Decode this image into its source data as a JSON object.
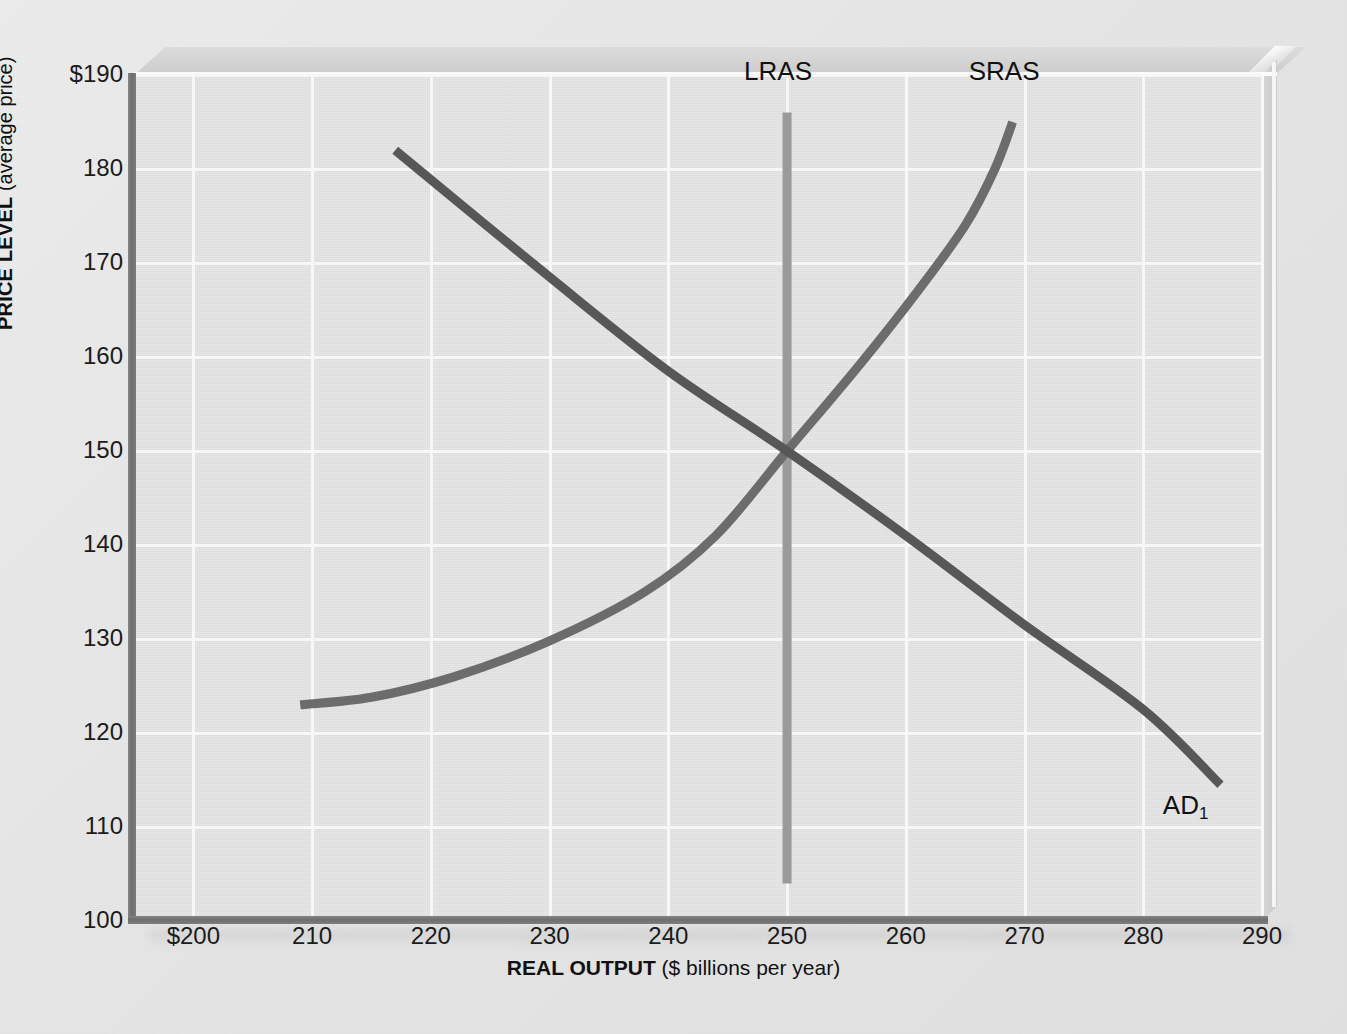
{
  "chart_data": {
    "type": "line",
    "title": "",
    "xlabel_bold": "REAL OUTPUT",
    "xlabel_rest": " ($ billions per year)",
    "ylabel_bold": "PRICE LEVEL",
    "ylabel_rest": " (average price)",
    "xlim": [
      195,
      290
    ],
    "ylim": [
      100,
      190
    ],
    "x_ticks": [
      "$200",
      "210",
      "220",
      "230",
      "240",
      "250",
      "260",
      "270",
      "280",
      "290"
    ],
    "x_tick_values": [
      200,
      210,
      220,
      230,
      240,
      250,
      260,
      270,
      280,
      290
    ],
    "y_ticks": [
      "$190",
      "180",
      "170",
      "160",
      "150",
      "140",
      "130",
      "120",
      "110",
      "100"
    ],
    "y_tick_values": [
      190,
      180,
      170,
      160,
      150,
      140,
      130,
      120,
      110,
      100
    ],
    "grid": true,
    "grid_color": "#f7f7f7",
    "plot_bg": "#e3e3e3",
    "legend_position": "inline-labels",
    "equilibrium": {
      "output": 250,
      "price_level": 150
    },
    "series": [
      {
        "name": "AD1",
        "label": "AD",
        "label_subscript": "1",
        "color": "#575757",
        "kind": "aggregate-demand",
        "points": [
          [
            217,
            182
          ],
          [
            230,
            168.5
          ],
          [
            240,
            158.5
          ],
          [
            250,
            150
          ],
          [
            260,
            141
          ],
          [
            270,
            131.5
          ],
          [
            280,
            122.5
          ],
          [
            286.5,
            114.5
          ]
        ]
      },
      {
        "name": "SRAS",
        "label": "SRAS",
        "color": "#6c6c6c",
        "kind": "short-run-aggregate-supply",
        "points": [
          [
            209,
            123
          ],
          [
            215,
            123.8
          ],
          [
            222,
            126
          ],
          [
            230,
            129.8
          ],
          [
            238,
            135
          ],
          [
            244,
            141
          ],
          [
            250,
            150
          ],
          [
            256,
            159
          ],
          [
            261,
            167
          ],
          [
            265,
            174
          ],
          [
            267.5,
            180
          ],
          [
            269,
            185
          ]
        ]
      },
      {
        "name": "LRAS",
        "label": "LRAS",
        "color": "#9a9a9a",
        "kind": "long-run-aggregate-supply",
        "points": [
          [
            250,
            104
          ],
          [
            250,
            186
          ]
        ]
      }
    ],
    "annotations": [
      {
        "text": "LRAS",
        "x": 250,
        "y": 190.5
      },
      {
        "text": "SRAS",
        "x": 268.5,
        "y": 190.5
      },
      {
        "text": "AD",
        "subscript": "1",
        "x": 283.5,
        "y": 112.5
      }
    ]
  }
}
